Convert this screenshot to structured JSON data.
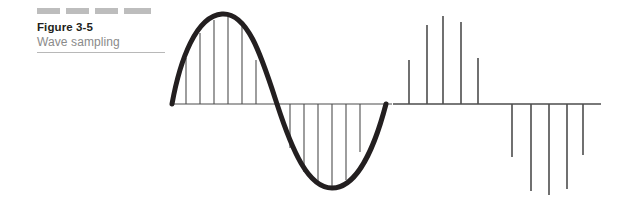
{
  "caption": {
    "figure_label": "Figure 3-5",
    "figure_title": "Wave sampling",
    "decor_dashes": 4,
    "dash_color": "#bdbdbd",
    "label_color": "#231f20",
    "title_color": "#8a8a8a",
    "rule_color": "#b8b8b8"
  },
  "chart_data": [
    {
      "id": "continuous-wave",
      "type": "line",
      "title": "Continuous sine wave with sample lines",
      "xlabel": "",
      "ylabel": "",
      "grid": false,
      "legend": "none",
      "stroke_color": "#231f20",
      "stroke_width": 5,
      "sample_line_color": "#4d4d4d",
      "sample_line_width": 1.1,
      "axis": {
        "x_start": 172,
        "x_end": 392,
        "y": 104,
        "color": "#4d4d4d",
        "width": 1.2
      },
      "wave": {
        "x_start": 172,
        "x_end": 386,
        "peak_x": 222,
        "peak_y": 14,
        "trough_x": 332,
        "trough_y": 188,
        "zero_cross_x": 277
      },
      "x": [
        0,
        15,
        30,
        45,
        60,
        75,
        90,
        105,
        120,
        135,
        150,
        165
      ],
      "y": [
        0.42,
        0.78,
        0.96,
        1.0,
        0.9,
        0.6,
        -0.28,
        -0.7,
        -0.93,
        -1.0,
        -0.86,
        -0.5
      ],
      "sample_positions_up": [
        186,
        200,
        214,
        228,
        242,
        256
      ],
      "sample_tops_up": [
        58,
        33,
        20,
        16,
        26,
        60
      ],
      "sample_positions_down": [
        290,
        304,
        318,
        332,
        346,
        360
      ],
      "sample_bottoms_down": [
        148,
        172,
        185,
        188,
        180,
        152
      ]
    },
    {
      "id": "sampled-impulses",
      "type": "bar",
      "title": "Sampled (quantized) impulse representation",
      "xlabel": "",
      "ylabel": "",
      "grid": false,
      "legend": "none",
      "stroke_color": "#4d4d4d",
      "stroke_width": 1.6,
      "axis": {
        "x_start": 393,
        "x_end": 601,
        "y": 104,
        "color": "#4d4d4d",
        "width": 1.4
      },
      "categories": [
        "s1",
        "s2",
        "s3",
        "s4",
        "s5",
        "s6",
        "s7",
        "s8",
        "s9",
        "s10"
      ],
      "values": [
        0.42,
        0.79,
        0.95,
        0.82,
        0.44,
        -0.5,
        -0.89,
        -0.95,
        -0.85,
        -0.48
      ],
      "ylim": [
        -1,
        1
      ],
      "impulses_up": [
        {
          "x": 409,
          "top": 60
        },
        {
          "x": 427,
          "top": 25
        },
        {
          "x": 443,
          "top": 16
        },
        {
          "x": 461,
          "top": 22
        },
        {
          "x": 478,
          "top": 58
        }
      ],
      "impulses_down": [
        {
          "x": 512,
          "bottom": 157
        },
        {
          "x": 531,
          "bottom": 191
        },
        {
          "x": 549,
          "bottom": 195
        },
        {
          "x": 567,
          "bottom": 189
        },
        {
          "x": 583,
          "bottom": 155
        }
      ]
    }
  ]
}
